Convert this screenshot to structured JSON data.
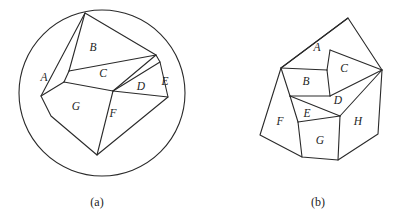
{
  "figure": {
    "background_color": "#ffffff",
    "stroke_color": "#2a2a2a",
    "label_color": "#1d1d1d",
    "panels": [
      {
        "id": "a",
        "caption": "(a)",
        "caption_pos": {
          "x": 97,
          "y": 203
        },
        "description": "Convex polygon partitioned into seven regions, inscribed in a circle",
        "boundary_shape": "circle",
        "circle": {
          "cx": 102,
          "cy": 93,
          "r": 83
        },
        "polygon_vertices": [
          {
            "name": "top-apex",
            "x": 85,
            "y": 13
          },
          {
            "name": "upper-right",
            "x": 156,
            "y": 55
          },
          {
            "name": "right-notch",
            "x": 160,
            "y": 62
          },
          {
            "name": "lower-right",
            "x": 168,
            "y": 97
          },
          {
            "name": "bottom",
            "x": 97,
            "y": 155
          },
          {
            "name": "lower-left",
            "x": 51,
            "y": 116
          },
          {
            "name": "left",
            "x": 41,
            "y": 96
          }
        ],
        "interior_cuts": [
          {
            "from": {
              "x": 85,
              "y": 13
            },
            "to": {
              "x": 69,
              "y": 71
            }
          },
          {
            "from": {
              "x": 69,
              "y": 71
            },
            "to": {
              "x": 156,
              "y": 55
            }
          },
          {
            "from": {
              "x": 69,
              "y": 71
            },
            "to": {
              "x": 64,
              "y": 82
            }
          },
          {
            "from": {
              "x": 64,
              "y": 82
            },
            "to": {
              "x": 41,
              "y": 96
            }
          },
          {
            "from": {
              "x": 64,
              "y": 82
            },
            "to": {
              "x": 113,
              "y": 91
            }
          },
          {
            "from": {
              "x": 113,
              "y": 91
            },
            "to": {
              "x": 156,
              "y": 55
            }
          },
          {
            "from": {
              "x": 113,
              "y": 91
            },
            "to": {
              "x": 160,
              "y": 62
            }
          },
          {
            "from": {
              "x": 113,
              "y": 91
            },
            "to": {
              "x": 168,
              "y": 97
            }
          },
          {
            "from": {
              "x": 113,
              "y": 91
            },
            "to": {
              "x": 97,
              "y": 155
            }
          }
        ],
        "regions": [
          {
            "label": "A",
            "x": 44,
            "y": 78
          },
          {
            "label": "B",
            "x": 93,
            "y": 48
          },
          {
            "label": "C",
            "x": 103,
            "y": 74
          },
          {
            "label": "D",
            "x": 141,
            "y": 87
          },
          {
            "label": "E",
            "x": 165,
            "y": 82
          },
          {
            "label": "F",
            "x": 113,
            "y": 114
          },
          {
            "label": "G",
            "x": 76,
            "y": 107
          }
        ]
      },
      {
        "id": "b",
        "caption": "(b)",
        "caption_pos": {
          "x": 318,
          "y": 203
        },
        "description": "Irregular polygon partitioned into eight regions",
        "boundary_shape": "polygon",
        "polygon_vertices": [
          {
            "name": "top-apex",
            "x": 348,
            "y": 18
          },
          {
            "name": "right-hub",
            "x": 382,
            "y": 70
          },
          {
            "name": "right-lower",
            "x": 378,
            "y": 134
          },
          {
            "name": "bottom-right",
            "x": 338,
            "y": 160
          },
          {
            "name": "bottom-left",
            "x": 302,
            "y": 157
          },
          {
            "name": "left",
            "x": 260,
            "y": 135
          },
          {
            "name": "upper-left",
            "x": 281,
            "y": 68
          }
        ],
        "interior_cuts": [
          {
            "from": {
              "x": 281,
              "y": 68
            },
            "to": {
              "x": 348,
              "y": 18
            }
          },
          {
            "from": {
              "x": 281,
              "y": 68
            },
            "to": {
              "x": 327,
              "y": 70
            }
          },
          {
            "from": {
              "x": 327,
              "y": 70
            },
            "to": {
              "x": 330,
              "y": 50
            }
          },
          {
            "from": {
              "x": 330,
              "y": 50
            },
            "to": {
              "x": 382,
              "y": 70
            }
          },
          {
            "from": {
              "x": 327,
              "y": 70
            },
            "to": {
              "x": 330,
              "y": 96
            }
          },
          {
            "from": {
              "x": 330,
              "y": 96
            },
            "to": {
              "x": 382,
              "y": 70
            }
          },
          {
            "from": {
              "x": 330,
              "y": 96
            },
            "to": {
              "x": 290,
              "y": 96
            }
          },
          {
            "from": {
              "x": 290,
              "y": 96
            },
            "to": {
              "x": 281,
              "y": 68
            }
          },
          {
            "from": {
              "x": 290,
              "y": 96
            },
            "to": {
              "x": 340,
              "y": 116
            }
          },
          {
            "from": {
              "x": 340,
              "y": 116
            },
            "to": {
              "x": 382,
              "y": 70
            }
          },
          {
            "from": {
              "x": 290,
              "y": 96
            },
            "to": {
              "x": 298,
              "y": 122
            }
          },
          {
            "from": {
              "x": 298,
              "y": 122
            },
            "to": {
              "x": 340,
              "y": 116
            }
          },
          {
            "from": {
              "x": 298,
              "y": 122
            },
            "to": {
              "x": 302,
              "y": 157
            }
          },
          {
            "from": {
              "x": 340,
              "y": 116
            },
            "to": {
              "x": 338,
              "y": 160
            }
          }
        ],
        "regions": [
          {
            "label": "A",
            "x": 317,
            "y": 48
          },
          {
            "label": "B",
            "x": 306,
            "y": 82
          },
          {
            "label": "C",
            "x": 344,
            "y": 69
          },
          {
            "label": "D",
            "x": 338,
            "y": 101
          },
          {
            "label": "E",
            "x": 307,
            "y": 114
          },
          {
            "label": "F",
            "x": 280,
            "y": 122
          },
          {
            "label": "G",
            "x": 320,
            "y": 141
          },
          {
            "label": "H",
            "x": 358,
            "y": 122
          }
        ]
      }
    ]
  }
}
